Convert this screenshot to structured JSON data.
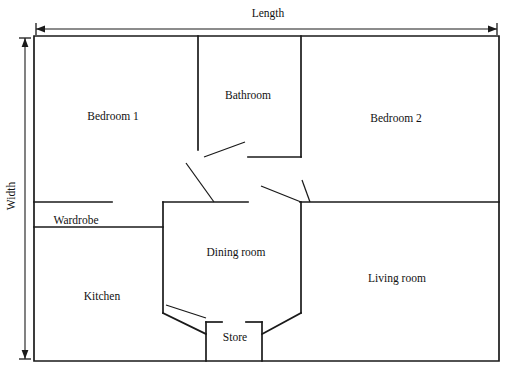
{
  "diagram": {
    "stroke_color": "#1a1a1a",
    "background_color": "#ffffff"
  },
  "dimensions": {
    "length": {
      "label": "Length",
      "x": 268,
      "y": 14
    },
    "width": {
      "label": "Width",
      "x": 12,
      "y": 196
    }
  },
  "rooms": [
    {
      "name": "bedroom-1",
      "label": "Bedroom 1",
      "x": 113,
      "y": 117
    },
    {
      "name": "bathroom",
      "label": "Bathroom",
      "x": 248,
      "y": 96
    },
    {
      "name": "bedroom-2",
      "label": "Bedroom 2",
      "x": 396,
      "y": 119
    },
    {
      "name": "wardrobe",
      "label": "Wardrobe",
      "x": 76,
      "y": 221
    },
    {
      "name": "kitchen",
      "label": "Kitchen",
      "x": 102,
      "y": 297
    },
    {
      "name": "dining-room",
      "label": "Dining room",
      "x": 236,
      "y": 253
    },
    {
      "name": "living-room",
      "label": "Living room",
      "x": 397,
      "y": 279
    },
    {
      "name": "store",
      "label": "Store",
      "x": 235,
      "y": 338
    }
  ],
  "walls": {
    "outer": "M34,36 L499,36 L499,361 L34,361 Z",
    "interior": [
      "M198,36 L198,157",
      "M301,36 L301,157",
      "M248,157 L301,157",
      "M198,157 L198,150",
      "M34,202 L112,202",
      "M34,227 L163,227",
      "M163,202 L163,227",
      "M163,202 L163,242",
      "M163,202 L248,202",
      "M300,202 L499,202",
      "M163,242 L163,313",
      "M301,202 L301,313",
      "M163,313 L206,334",
      "M301,313 L262,334",
      "M206,322 L206,361",
      "M262,322 L262,361",
      "M206,322 L222,322",
      "M246,322 L262,322"
    ],
    "door_leaves": [
      "M204,157 L245,142",
      "M186,163 L214,202",
      "M261,186 L301,202",
      "M302,180 L310,202",
      "M166,305 L206,318"
    ]
  },
  "colors": {
    "line": "#1a1a1a",
    "text": "#111111",
    "background": "#ffffff"
  }
}
